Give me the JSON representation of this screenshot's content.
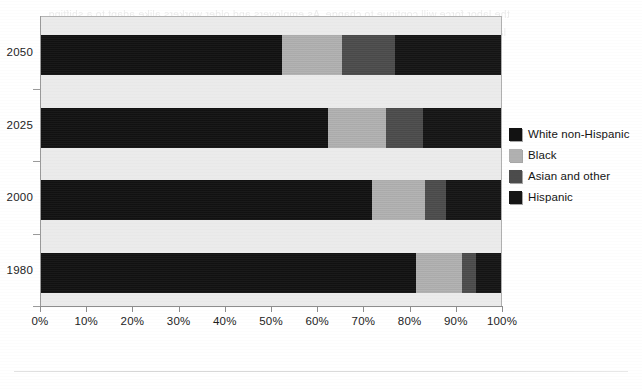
{
  "chart_data": {
    "type": "bar",
    "orientation": "horizontal",
    "stacked": true,
    "normalized": true,
    "title": "",
    "xlabel": "",
    "ylabel": "",
    "xlim": [
      0,
      100
    ],
    "grid": false,
    "legend_position": "right",
    "categories": [
      "2050",
      "2025",
      "2000",
      "1980"
    ],
    "x_tick_labels": [
      "0%",
      "10%",
      "20%",
      "30%",
      "40%",
      "50%",
      "60%",
      "70%",
      "80%",
      "90%",
      "100%"
    ],
    "x_tick_values": [
      0,
      10,
      20,
      30,
      40,
      50,
      60,
      70,
      80,
      90,
      100
    ],
    "series": [
      {
        "name": "White non-Hispanic",
        "color": "#121212",
        "key": "white",
        "values": [
          52.5,
          62.5,
          72.0,
          81.5
        ]
      },
      {
        "name": "Black",
        "color": "#b1b1b1",
        "key": "black",
        "values": [
          13.0,
          12.5,
          11.5,
          10.0
        ]
      },
      {
        "name": "Asian and other",
        "color": "#4c4c4c",
        "key": "asian",
        "values": [
          11.5,
          8.0,
          4.5,
          3.0
        ]
      },
      {
        "name": "Hispanic",
        "color": "#151515",
        "key": "hispanic",
        "values": [
          23.0,
          17.0,
          12.0,
          5.5
        ]
      }
    ]
  },
  "legend": {
    "items": [
      {
        "label": "White non-Hispanic",
        "color": "#121212",
        "swatch_name": "legend-swatch-white-non-hispanic"
      },
      {
        "label": "Black",
        "color": "#b1b1b1",
        "swatch_name": "legend-swatch-black"
      },
      {
        "label": "Asian and other",
        "color": "#4c4c4c",
        "swatch_name": "legend-swatch-asian-and-other"
      },
      {
        "label": "Hispanic",
        "color": "#151515",
        "swatch_name": "legend-swatch-hispanic"
      }
    ]
  },
  "page": {
    "bleed_text": "the labor force will continue to change. As employers and older workers alike adapt to a shifting labor market, the composition of the workforce will shift as well. Projections suggest a steadily more diverse population through the coming decades."
  }
}
